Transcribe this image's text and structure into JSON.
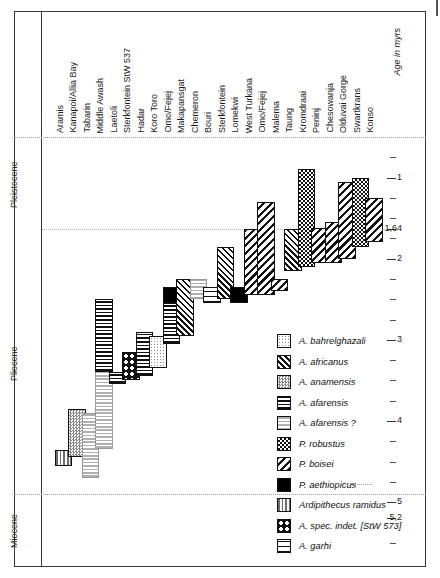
{
  "axis": {
    "title": "Age in myrs",
    "major_ticks": [
      {
        "value": 1,
        "label": "1"
      },
      {
        "value": 1.64,
        "label": "1,64"
      },
      {
        "value": 2,
        "label": "2"
      },
      {
        "value": 3,
        "label": "3"
      },
      {
        "value": 4,
        "label": "4"
      },
      {
        "value": 5,
        "label": "5"
      },
      {
        "value": 5.2,
        "label": "5,2"
      }
    ]
  },
  "epochs": [
    {
      "name": "Pleistocene",
      "top": 0.5,
      "bottom": 1.81
    },
    {
      "name": "Pliocene",
      "top": 1.81,
      "bottom": 5.2
    },
    {
      "name": "Miocene",
      "top": 5.2,
      "bottom": 5.8
    }
  ],
  "legend": [
    {
      "key": "bahrelghazali",
      "label": "A. bahrelghazali",
      "pattern": "p-bahrelghazali"
    },
    {
      "key": "africanus",
      "label": "A. africanus",
      "pattern": "p-africanus"
    },
    {
      "key": "anamensis",
      "label": "A. anamensis",
      "pattern": "p-anamensis"
    },
    {
      "key": "afarensis",
      "label": "A. afarensis",
      "pattern": "p-afarensis"
    },
    {
      "key": "afarensis_q",
      "label": "A. afarensis ?",
      "pattern": "p-afarensisq"
    },
    {
      "key": "robustus",
      "label": "P. robustus",
      "pattern": "p-robustus"
    },
    {
      "key": "boisei",
      "label": "P. boisei",
      "pattern": "p-boisei"
    },
    {
      "key": "aethiopicus",
      "label": "P. aethiopicus",
      "pattern": "p-aethiopicus"
    },
    {
      "key": "ardipithecus",
      "label": "Ardipithecus ramidus",
      "pattern": "p-ardipithecus"
    },
    {
      "key": "stw573",
      "label": "A. spec. indet. [StW 573]",
      "pattern": "p-stw573"
    },
    {
      "key": "garhi",
      "label": "A. garhi",
      "pattern": "p-garhi"
    }
  ],
  "chart_data": {
    "type": "bar",
    "title": "",
    "xlabel": "",
    "ylabel": "Age in myrs",
    "ylim": [
      0.5,
      5.8
    ],
    "y_inverted": true,
    "grid": true,
    "legend_position": "inside-right",
    "categories": [
      "Aramis",
      "Kanapoi/Allia Bay",
      "Tabarin",
      "Middle Awash",
      "Laetoli",
      "Sterkfontein StW 537",
      "Hadar",
      "Koro Toro",
      "Omo/Fejej",
      "Makapansgat",
      "Chemeron",
      "Bouri",
      "Sterkfontein",
      "Lomekwi",
      "West Turkana",
      "Omo/Fejej",
      "Malema",
      "Taung",
      "Kromdraai",
      "Peninj",
      "Chesowanja",
      "Olduvai Gorge",
      "Swartkrans",
      "Konso"
    ],
    "annotations": [
      "1,64 boundary line",
      "5,2 boundary line"
    ],
    "ranges": [
      {
        "site": "Aramis",
        "species": "ardipithecus",
        "from": 4.55,
        "to": 4.36
      },
      {
        "site": "Kanapoi/Allia Bay",
        "species": "anamensis",
        "from": 4.45,
        "to": 3.85
      },
      {
        "site": "Tabarin",
        "species": "afarensis_q",
        "from": 4.7,
        "to": 3.9
      },
      {
        "site": "Middle Awash",
        "species": "afarensis_q",
        "from": 4.35,
        "to": 3.35
      },
      {
        "site": "Middle Awash",
        "species": "afarensis",
        "from": 3.4,
        "to": 2.5
      },
      {
        "site": "Laetoli",
        "species": "afarensis",
        "from": 3.55,
        "to": 3.4
      },
      {
        "site": "Sterkfontein StW 537",
        "species": "stw573",
        "from": 3.5,
        "to": 3.15
      },
      {
        "site": "Hadar",
        "species": "afarensis",
        "from": 3.45,
        "to": 2.9
      },
      {
        "site": "Koro Toro",
        "species": "bahrelghazali",
        "from": 3.35,
        "to": 2.95
      },
      {
        "site": "Omo/Fejej",
        "species": "afarensis",
        "from": 3.05,
        "to": 2.55
      },
      {
        "site": "Omo/Fejej",
        "species": "aethiopicus",
        "from": 2.55,
        "to": 2.35
      },
      {
        "site": "Makapansgat",
        "species": "africanus",
        "from": 2.95,
        "to": 2.25
      },
      {
        "site": "Chemeron",
        "species": "afarensis_q",
        "from": 2.5,
        "to": 2.25
      },
      {
        "site": "Bouri",
        "species": "garhi",
        "from": 2.55,
        "to": 2.35
      },
      {
        "site": "Sterkfontein",
        "species": "africanus",
        "from": 2.5,
        "to": 1.85
      },
      {
        "site": "Lomekwi",
        "species": "aethiopicus",
        "from": 2.55,
        "to": 2.35
      },
      {
        "site": "West Turkana",
        "species": "boisei",
        "from": 2.45,
        "to": 1.64
      },
      {
        "site": "Omo/Fejej",
        "species": "boisei",
        "from": 2.45,
        "to": 1.3
      },
      {
        "site": "Malema",
        "species": "boisei",
        "from": 2.4,
        "to": 2.25
      },
      {
        "site": "Taung",
        "species": "africanus",
        "from": 2.15,
        "to": 1.64
      },
      {
        "site": "Kromdraai",
        "species": "robustus",
        "from": 2.1,
        "to": 0.9
      },
      {
        "site": "Peninj",
        "species": "boisei",
        "from": 2.05,
        "to": 1.62
      },
      {
        "site": "Chesowanja",
        "species": "boisei",
        "from": 2.05,
        "to": 1.55
      },
      {
        "site": "Olduvai Gorge",
        "species": "boisei",
        "from": 2.0,
        "to": 1.05
      },
      {
        "site": "Swartkrans",
        "species": "robustus",
        "from": 1.85,
        "to": 1.0
      },
      {
        "site": "Konso",
        "species": "boisei",
        "from": 1.8,
        "to": 1.25
      }
    ]
  }
}
